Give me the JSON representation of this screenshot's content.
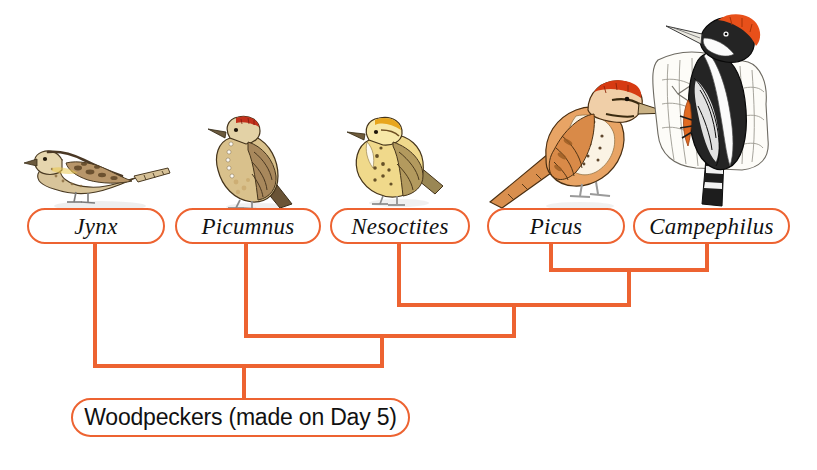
{
  "figure": {
    "kind": "cladogram",
    "title_label": "Woodpeckers (made on Day 5)",
    "background_color": "#ffffff",
    "line_color": "#ED6331",
    "box_border_color": "#ED6331",
    "text_color": "#111111"
  },
  "taxa": [
    {
      "id": "jynx",
      "label": "Jynx",
      "common": "wryneck",
      "illustration": "bird-jynx-illustration",
      "posture": "horizontal-perched-facing-left",
      "plumage": [
        "mottled brown",
        "tan",
        "cream barring"
      ]
    },
    {
      "id": "picumnus",
      "label": "Picumnus",
      "common": "piculet",
      "illustration": "bird-picumnus-illustration",
      "posture": "upright-perched-facing-left",
      "plumage": [
        "brown",
        "buff",
        "red crown patch",
        "white spotting"
      ]
    },
    {
      "id": "nesoctites",
      "label": "Nesoctites",
      "common": "Antillean piculet",
      "illustration": "bird-nesoctites-illustration",
      "posture": "upright-perched-facing-left",
      "plumage": [
        "yellow-olive",
        "spotted breast",
        "golden crown"
      ]
    },
    {
      "id": "picus",
      "label": "Picus",
      "common": "flicker",
      "illustration": "bird-picus-illustration",
      "posture": "upright-facing-right",
      "plumage": [
        "orange-brown",
        "red crown",
        "spotted white breast"
      ]
    },
    {
      "id": "campephilus",
      "label": "Campephilus",
      "common": "ivory-billed woodpecker",
      "illustration": "bird-campephilus-illustration",
      "posture": "clinging-to-trunk-vertical",
      "plumage": [
        "black",
        "white stripes",
        "red crest",
        "pale bill"
      ]
    }
  ],
  "root": {
    "label": "Woodpeckers (made on Day 5)"
  },
  "topology": {
    "description": "nested ladder: Jynx basal, then Picumnus, then Nesoctites, with Picus and Campephilus as sister taxa",
    "clades": [
      {
        "id": "picus-campephilus",
        "members": [
          "picus",
          "campephilus"
        ]
      },
      {
        "id": "nesoctites-clade",
        "members": [
          "nesoctites",
          "picus-campephilus"
        ]
      },
      {
        "id": "picumnus-clade",
        "members": [
          "picumnus",
          "nesoctites-clade"
        ]
      },
      {
        "id": "woodpeckers",
        "members": [
          "jynx",
          "picumnus-clade"
        ]
      }
    ]
  }
}
